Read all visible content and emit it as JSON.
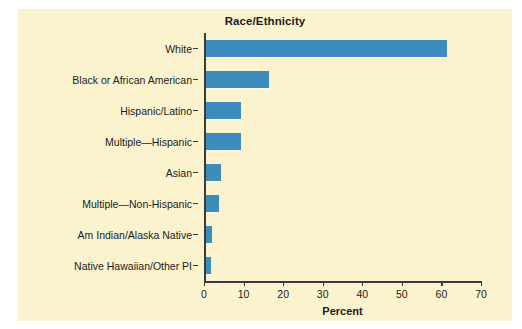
{
  "caption": {
    "clipped_text": "                                                                                                                                  "
  },
  "chart_data": {
    "type": "bar",
    "orientation": "horizontal",
    "title": "Race/Ethnicity",
    "xlabel": "Percent",
    "ylabel": "",
    "xlim": [
      0,
      70
    ],
    "xticks": [
      0,
      10,
      20,
      30,
      40,
      50,
      60,
      70
    ],
    "grid": false,
    "legend": null,
    "categories": [
      "White",
      "Black or African American",
      "Hispanic/Latino",
      "Multiple—Hispanic",
      "Asian",
      "Multiple—Non-Hispanic",
      "Am Indian/Alaska Native",
      "Native Hawaiian/Other PI"
    ],
    "values": [
      61,
      16,
      9,
      9,
      4,
      3.5,
      1.7,
      1.5
    ],
    "colors": {
      "bar": "#3d8dbc",
      "plot_background": "#fbf3ce",
      "axis": "#3a3a3a",
      "text": "#1b1b1b"
    }
  }
}
